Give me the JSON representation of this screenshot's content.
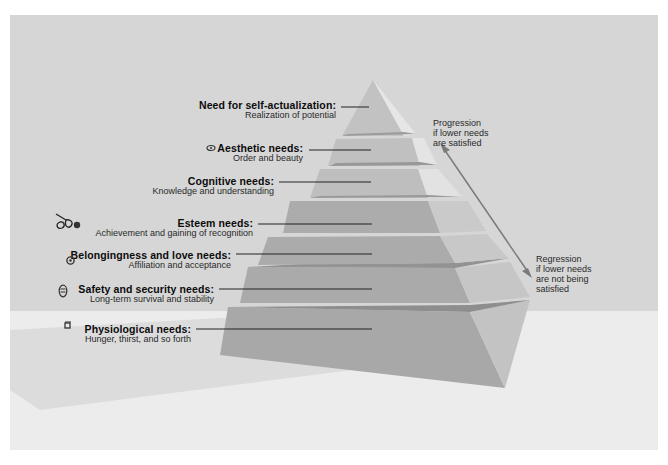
{
  "diagram": {
    "levels": [
      {
        "title": "Need for self-actualization:",
        "subtitle": "Realization of potential",
        "icon": ""
      },
      {
        "title": "Aesthetic needs:",
        "subtitle": "Order and beauty",
        "icon": "flower-icon"
      },
      {
        "title": "Cognitive needs:",
        "subtitle": "Knowledge and understanding",
        "icon": ""
      },
      {
        "title": "Esteem needs:",
        "subtitle": "Achievement and gaining of recognition",
        "icon": "trophy-icon"
      },
      {
        "title": "Belongingness and love needs:",
        "subtitle": "Affiliation and acceptance",
        "icon": "people-icon"
      },
      {
        "title": "Safety and security needs:",
        "subtitle": "Long-term survival and stability",
        "icon": "lock-icon"
      },
      {
        "title": "Physiological needs:",
        "subtitle": "Hunger, thirst, and so forth",
        "icon": "cup-icon"
      }
    ],
    "progression": {
      "line1": "Progression",
      "line2": "if lower needs",
      "line3": "are satisfied"
    },
    "regression": {
      "line1": "Regression",
      "line2": "if lower needs",
      "line3": "are not being",
      "line4": "satisfied"
    }
  },
  "colors": {
    "background": "#d6d6d6",
    "floor": "#ececec",
    "upper_front": "#bdbdbd",
    "upper_side": "#dedede",
    "lower_front": "#a9a9a9",
    "lower_side": "#c4c4c4",
    "arrow": "#7a7a7a"
  }
}
